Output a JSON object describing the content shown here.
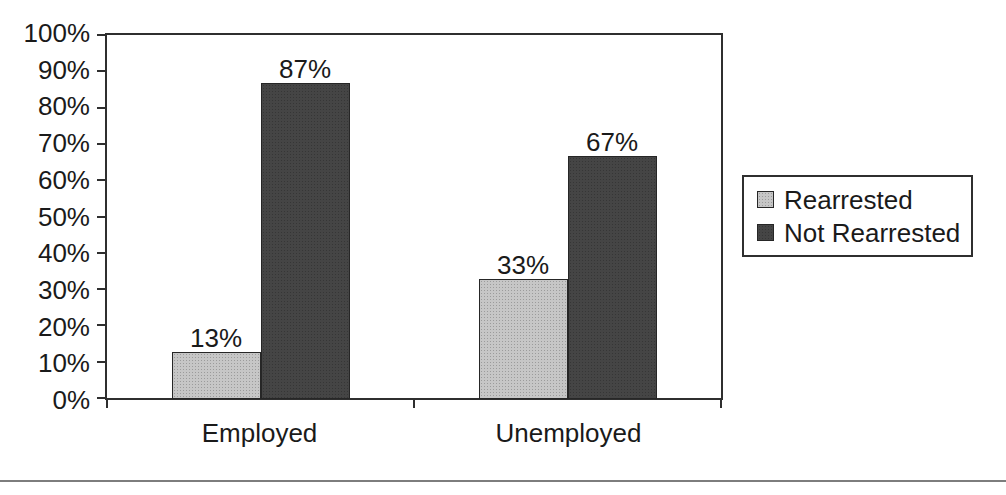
{
  "chart_data": {
    "type": "bar",
    "title": "",
    "categories": [
      "Employed",
      "Unemployed"
    ],
    "series": [
      {
        "name": "Rearrested",
        "color": "#c6c6c6",
        "values": [
          13,
          33
        ],
        "labels": [
          "13%",
          "33%"
        ]
      },
      {
        "name": "Not Rearrested",
        "color": "#454545",
        "values": [
          87,
          67
        ],
        "labels": [
          "87%",
          "67%"
        ]
      }
    ],
    "ylim": [
      0,
      100
    ],
    "yticks": [
      "0%",
      "10%",
      "20%",
      "30%",
      "40%",
      "50%",
      "60%",
      "70%",
      "80%",
      "90%",
      "100%"
    ],
    "grid": false,
    "legend_position": "right",
    "colors": {
      "axis": "#2f2f2f",
      "text": "#1a1a1a",
      "plot_background": "#ffffff",
      "bottom_rule": "#7d7d7d"
    }
  }
}
